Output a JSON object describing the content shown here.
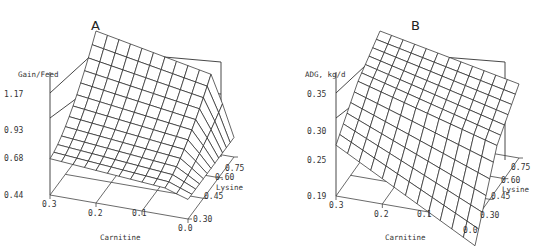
{
  "figure": {
    "panels": [
      "A",
      "B"
    ]
  },
  "chart_data": [
    {
      "type": "surface3d",
      "title": "A",
      "zlabel": "Gain/Feed",
      "xlabel": "Carnitine",
      "ylabel": "Lysine",
      "x_ticks": [
        "0.3",
        "0.2",
        "0.1",
        "0.0"
      ],
      "y_ticks": [
        "0.30",
        "0.45",
        "0.60",
        "0.75"
      ],
      "z_ticks": [
        "0.44",
        "0.68",
        "0.93",
        "1.17"
      ],
      "xlim": [
        0.0,
        0.3
      ],
      "ylim": [
        0.3,
        0.75
      ],
      "zlim": [
        0.44,
        1.17
      ],
      "description": "Gain/Feed surface highest (~1.17) at carnitine 0.3 / lysine 0.75 corner, sloping down toward low lysine; drops sharply near carnitine 0.0 to ~0.6",
      "grid": {
        "carnitine": [
          0.3,
          0.25,
          0.2,
          0.15,
          0.1,
          0.05,
          0.0
        ],
        "lysine": [
          0.3,
          0.375,
          0.45,
          0.525,
          0.6,
          0.675,
          0.75
        ],
        "z_at_lysine_0.75": [
          1.17,
          1.12,
          1.07,
          1.03,
          1.0,
          0.96,
          0.66
        ],
        "z_at_lysine_0.30": [
          0.7,
          0.69,
          0.68,
          0.67,
          0.66,
          0.65,
          0.6
        ]
      }
    },
    {
      "type": "surface3d",
      "title": "B",
      "zlabel": "ADG, kg/d",
      "xlabel": "Carnitine",
      "ylabel": "Lysine",
      "x_ticks": [
        "0.3",
        "0.2",
        "0.1",
        "0.0"
      ],
      "y_ticks": [
        "0.30",
        "0.45",
        "0.60",
        "0.75"
      ],
      "z_ticks": [
        "0.19",
        "0.25",
        "0.30",
        "0.35"
      ],
      "xlim": [
        0.0,
        0.3
      ],
      "ylim": [
        0.3,
        0.75
      ],
      "zlim": [
        0.19,
        0.35
      ],
      "description": "ADG surface peaks (~0.35) at carnitine 0.3 / lysine 0.75; minimum (~0.21) near carnitine 0.0 / lysine 0.30; saddle-like shape",
      "grid": {
        "carnitine": [
          0.3,
          0.25,
          0.2,
          0.15,
          0.1,
          0.05,
          0.0
        ],
        "lysine": [
          0.3,
          0.375,
          0.45,
          0.525,
          0.6,
          0.675,
          0.75
        ],
        "z_at_lysine_0.75": [
          0.35,
          0.34,
          0.33,
          0.325,
          0.32,
          0.315,
          0.31
        ],
        "z_at_lysine_0.30": [
          0.29,
          0.27,
          0.26,
          0.245,
          0.23,
          0.22,
          0.21
        ]
      }
    }
  ]
}
